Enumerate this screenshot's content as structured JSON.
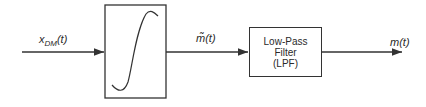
{
  "diagram": {
    "input_label": {
      "main": "x",
      "sub": "DM",
      "arg": "(t)"
    },
    "nonlinear_block": {
      "shape": "s-curve"
    },
    "intermediate_label": "m̃(t)",
    "lpf_block": {
      "line1": "Low-Pass",
      "line2": "Filter",
      "line3": "(LPF)"
    },
    "output_label": "m(t)",
    "colors": {
      "stroke": "#333333",
      "background": "#ffffff"
    }
  }
}
